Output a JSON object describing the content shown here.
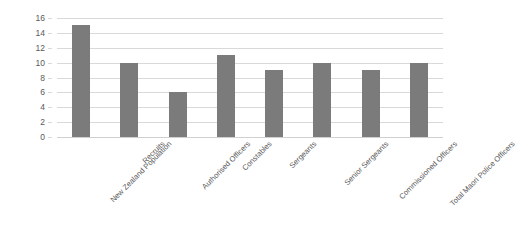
{
  "chart_data": {
    "type": "bar",
    "title": "",
    "subtitle": "",
    "xlabel": "",
    "ylabel": "",
    "categories": [
      "New Zealand Population",
      "Recruits",
      "Authorised Officers",
      "Constables",
      "Sergeants",
      "Senior Sergeants",
      "Commissioned Officers",
      "Total Maori Police Officers"
    ],
    "values": [
      15,
      10,
      6,
      11,
      9,
      10,
      9,
      10
    ],
    "ylim": [
      0,
      16
    ],
    "ytick_step": 2,
    "yticks": [
      "0",
      "2",
      "4",
      "6",
      "8",
      "10",
      "12",
      "14",
      "16"
    ],
    "grid": true,
    "grid_axis": "y",
    "legend": false,
    "legend_position": "none",
    "bar_color": "#7b7b7b",
    "gridline_color": "#d9d9d9",
    "background_color": "#ffffff",
    "tick_label_color": "#595959",
    "xtick_rotation": -45
  }
}
